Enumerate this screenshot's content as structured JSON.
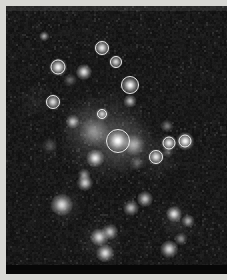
{
  "figure": {
    "kind": "astronomical-image",
    "colormap": "grayscale",
    "background_color": "#090909",
    "border_color": "#d8d8d4",
    "marker_color": "#fafafa",
    "plate": {
      "x": 6,
      "y": 6,
      "width": 221,
      "height": 268
    }
  },
  "chart_data": {
    "type": "scatter",
    "title": "",
    "xlabel": "",
    "ylabel": "",
    "xlim": [
      0,
      221
    ],
    "ylim": [
      0,
      268
    ],
    "grid": false,
    "legend": null,
    "note": "Grayscale star field; x/y are pixel coordinates on the plate, brightness is relative peak intensity 0-1, fwhm is the source width in pixels, circled indicates an annotation ring is drawn on the source.",
    "series": [
      {
        "name": "sources",
        "points": [
          {
            "x": 38,
            "y": 30,
            "brightness": 0.62,
            "fwhm": 3.0,
            "circled": false
          },
          {
            "x": 96,
            "y": 42,
            "brightness": 0.88,
            "fwhm": 5.0,
            "circled": true,
            "radius": 7.0
          },
          {
            "x": 52,
            "y": 61,
            "brightness": 0.92,
            "fwhm": 5.5,
            "circled": true,
            "radius": 7.5
          },
          {
            "x": 110,
            "y": 56,
            "brightness": 0.8,
            "fwhm": 4.5,
            "circled": true,
            "radius": 6.0
          },
          {
            "x": 78,
            "y": 66,
            "brightness": 0.86,
            "fwhm": 5.0,
            "circled": false
          },
          {
            "x": 64,
            "y": 74,
            "brightness": 0.34,
            "fwhm": 4.0,
            "circled": false
          },
          {
            "x": 124,
            "y": 79,
            "brightness": 0.95,
            "fwhm": 5.5,
            "circled": true,
            "radius": 9.0
          },
          {
            "x": 47,
            "y": 96,
            "brightness": 0.84,
            "fwhm": 5.0,
            "circled": true,
            "radius": 7.0
          },
          {
            "x": 124,
            "y": 95,
            "brightness": 0.7,
            "fwhm": 4.0,
            "circled": false
          },
          {
            "x": 96,
            "y": 108,
            "brightness": 0.74,
            "fwhm": 4.0,
            "circled": true,
            "radius": 5.0
          },
          {
            "x": 67,
            "y": 116,
            "brightness": 0.72,
            "fwhm": 4.5,
            "circled": false
          },
          {
            "x": 112,
            "y": 135,
            "brightness": 1.0,
            "fwhm": 7.0,
            "circled": true,
            "radius": 12.0
          },
          {
            "x": 88,
            "y": 126,
            "brightness": 0.4,
            "fwhm": 9.0,
            "circled": false
          },
          {
            "x": 128,
            "y": 139,
            "brightness": 0.58,
            "fwhm": 7.0,
            "circled": false
          },
          {
            "x": 150,
            "y": 151,
            "brightness": 0.86,
            "fwhm": 5.0,
            "circled": true,
            "radius": 7.0
          },
          {
            "x": 162,
            "y": 146,
            "brightness": 0.3,
            "fwhm": 3.5,
            "circled": false
          },
          {
            "x": 163,
            "y": 137,
            "brightness": 0.88,
            "fwhm": 5.0,
            "circled": true,
            "radius": 6.5
          },
          {
            "x": 179,
            "y": 135,
            "brightness": 0.96,
            "fwhm": 5.5,
            "circled": true,
            "radius": 6.5
          },
          {
            "x": 161,
            "y": 120,
            "brightness": 0.42,
            "fwhm": 4.0,
            "circled": false
          },
          {
            "x": 89,
            "y": 152,
            "brightness": 0.9,
            "fwhm": 5.5,
            "circled": false
          },
          {
            "x": 79,
            "y": 177,
            "brightness": 0.78,
            "fwhm": 5.0,
            "circled": false
          },
          {
            "x": 78,
            "y": 169,
            "brightness": 0.52,
            "fwhm": 4.0,
            "circled": false
          },
          {
            "x": 56,
            "y": 199,
            "brightness": 0.82,
            "fwhm": 7.0,
            "circled": false
          },
          {
            "x": 139,
            "y": 193,
            "brightness": 0.72,
            "fwhm": 5.0,
            "circled": false
          },
          {
            "x": 125,
            "y": 202,
            "brightness": 0.66,
            "fwhm": 5.0,
            "circled": false
          },
          {
            "x": 168,
            "y": 208,
            "brightness": 0.86,
            "fwhm": 5.0,
            "circled": false
          },
          {
            "x": 182,
            "y": 215,
            "brightness": 0.62,
            "fwhm": 4.0,
            "circled": false
          },
          {
            "x": 104,
            "y": 226,
            "brightness": 0.7,
            "fwhm": 5.0,
            "circled": false
          },
          {
            "x": 93,
            "y": 231,
            "brightness": 0.8,
            "fwhm": 5.5,
            "circled": false
          },
          {
            "x": 99,
            "y": 247,
            "brightness": 0.84,
            "fwhm": 5.5,
            "circled": false
          },
          {
            "x": 163,
            "y": 243,
            "brightness": 0.8,
            "fwhm": 5.5,
            "circled": false
          },
          {
            "x": 175,
            "y": 233,
            "brightness": 0.46,
            "fwhm": 4.0,
            "circled": false
          },
          {
            "x": 131,
            "y": 157,
            "brightness": 0.3,
            "fwhm": 4.0,
            "circled": false
          },
          {
            "x": 44,
            "y": 140,
            "brightness": 0.26,
            "fwhm": 5.0,
            "circled": false
          }
        ]
      }
    ],
    "diffuse_glow": [
      {
        "x": 100,
        "y": 130,
        "radius": 46,
        "intensity": 0.2
      },
      {
        "x": 120,
        "y": 138,
        "radius": 30,
        "intensity": 0.16
      },
      {
        "x": 80,
        "y": 120,
        "radius": 26,
        "intensity": 0.12
      },
      {
        "x": 150,
        "y": 150,
        "radius": 26,
        "intensity": 0.1
      },
      {
        "x": 95,
        "y": 235,
        "radius": 24,
        "intensity": 0.1
      },
      {
        "x": 60,
        "y": 200,
        "radius": 20,
        "intensity": 0.09
      },
      {
        "x": 170,
        "y": 215,
        "radius": 20,
        "intensity": 0.09
      },
      {
        "x": 30,
        "y": 95,
        "radius": 18,
        "intensity": 0.06
      }
    ]
  }
}
